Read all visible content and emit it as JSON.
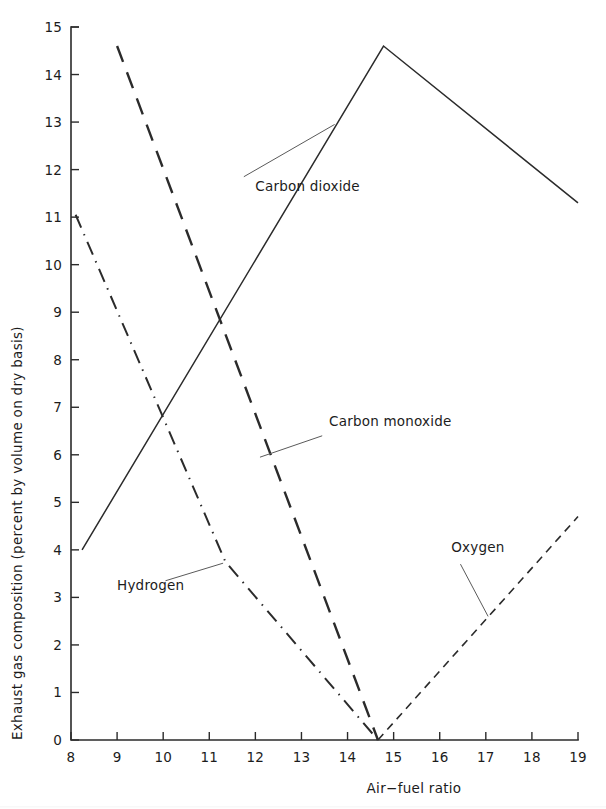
{
  "figure": {
    "background_color": "#ffffff",
    "ink_color": "#2b2b2b",
    "leader_color": "#5a5a5a"
  },
  "chart_data": {
    "type": "line",
    "title": "",
    "xlabel": "Air−fuel ratio",
    "ylabel": "Exhaust gas composition (percent by volume on dry basis)",
    "xlim": [
      8,
      19
    ],
    "ylim": [
      0,
      15
    ],
    "xticks": [
      8,
      9,
      10,
      11,
      12,
      13,
      14,
      15,
      16,
      17,
      18,
      19
    ],
    "yticks": [
      0,
      1,
      2,
      3,
      4,
      5,
      6,
      7,
      8,
      9,
      10,
      11,
      12,
      13,
      14,
      15
    ],
    "xtick_labels": [
      "8",
      "9",
      "10",
      "11",
      "12",
      "13",
      "14",
      "15",
      "16",
      "17",
      "18",
      "19"
    ],
    "ytick_labels": [
      "0",
      "1",
      "2",
      "3",
      "4",
      "5",
      "6",
      "7",
      "8",
      "9",
      "10",
      "11",
      "12",
      "13",
      "14",
      "15"
    ],
    "grid": false,
    "legend": "inline-labels-with-leader-lines",
    "series": [
      {
        "name": "Carbon dioxide",
        "label": "Carbon dioxide",
        "linestyle": "solid",
        "color": "#2b2b2b",
        "x": [
          8.24,
          14.78,
          19.0
        ],
        "y": [
          4.0,
          14.6,
          11.3
        ],
        "label_position": {
          "x": 12.0,
          "y": 11.55
        },
        "leader_from": {
          "x": 11.75,
          "y": 11.85
        },
        "leader_to": {
          "x": 13.72,
          "y": 12.95
        }
      },
      {
        "name": "Carbon monoxide",
        "label": "Carbon monoxide",
        "linestyle": "long-dash",
        "color": "#2b2b2b",
        "x": [
          9.0,
          14.66
        ],
        "y": [
          14.6,
          0.0
        ],
        "label_position": {
          "x": 13.6,
          "y": 6.6
        },
        "leader_from": {
          "x": 13.45,
          "y": 6.4
        },
        "leader_to": {
          "x": 12.1,
          "y": 5.95
        }
      },
      {
        "name": "Hydrogen",
        "label": "Hydrogen",
        "linestyle": "dash-dot",
        "color": "#2b2b2b",
        "x": [
          8.1,
          11.35,
          14.66
        ],
        "y": [
          11.05,
          3.75,
          0.0
        ],
        "label_position": {
          "x": 9.0,
          "y": 3.15
        },
        "leader_from": {
          "x": 10.05,
          "y": 3.35
        },
        "leader_to": {
          "x": 11.3,
          "y": 3.72
        }
      },
      {
        "name": "Oxygen",
        "label": "Oxygen",
        "linestyle": "short-dash",
        "color": "#2b2b2b",
        "x": [
          14.66,
          19.0
        ],
        "y": [
          0.0,
          4.7
        ],
        "label_position": {
          "x": 16.25,
          "y": 3.95
        },
        "leader_from": {
          "x": 16.45,
          "y": 3.7
        },
        "leader_to": {
          "x": 17.05,
          "y": 2.6
        }
      }
    ]
  }
}
